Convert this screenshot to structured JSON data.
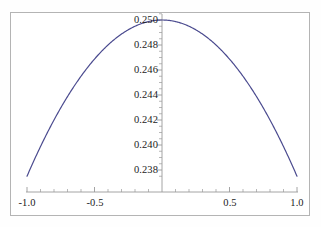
{
  "figure": {
    "name": "parabola-plot",
    "background_color": "#ffffff",
    "frame_color": "#b4b4b4",
    "axis_color": "#9a9a9a",
    "curve_color": "#4b4b8f",
    "text_color": "#1b1b1b"
  },
  "chart_data": {
    "type": "line",
    "title": "",
    "subtitle": "",
    "xlabel": "",
    "ylabel": "",
    "xlim": [
      -1.0,
      1.0
    ],
    "ylim": [
      0.237,
      0.2504
    ],
    "grid": false,
    "legend": null,
    "legend_position": "none",
    "x_ticks": [
      -1.0,
      -0.5,
      0.5,
      1.0
    ],
    "x_tick_labels": [
      "-1.0",
      "-0.5",
      "0.5",
      "1.0"
    ],
    "x_minor_tick_step": 0.1,
    "y_ticks": [
      0.238,
      0.24,
      0.242,
      0.244,
      0.246,
      0.248,
      0.25
    ],
    "y_tick_labels": [
      "0.238",
      "0.240",
      "0.242",
      "0.244",
      "0.246",
      "0.248",
      "0.250"
    ],
    "y_minor_tick_step": 0.0005,
    "series": [
      {
        "name": "curve",
        "color": "#4b4b8f",
        "line_width": 1.2,
        "x": [
          -1.0,
          -0.95,
          -0.9,
          -0.85,
          -0.8,
          -0.75,
          -0.7,
          -0.65,
          -0.6,
          -0.55,
          -0.5,
          -0.45,
          -0.4,
          -0.35,
          -0.3,
          -0.25,
          -0.2,
          -0.15,
          -0.1,
          -0.05,
          0.0,
          0.05,
          0.1,
          0.15,
          0.2,
          0.25,
          0.3,
          0.35,
          0.4,
          0.45,
          0.5,
          0.55,
          0.6,
          0.65,
          0.7,
          0.75,
          0.8,
          0.85,
          0.9,
          0.95,
          1.0
        ],
        "y": [
          0.2375,
          0.23806,
          0.23858,
          0.23903,
          0.23944,
          0.2398,
          0.24011,
          0.24038,
          0.2406,
          0.24078,
          0.24091,
          0.241,
          0.24104,
          0.24104,
          0.24104,
          0.24104,
          0.24104,
          0.24104,
          0.24104,
          0.24104,
          0.25,
          0.24104,
          0.24104,
          0.24104,
          0.24104,
          0.24104,
          0.24104,
          0.24104,
          0.24104,
          0.241,
          0.24091,
          0.24078,
          0.2406,
          0.24038,
          0.24011,
          0.2398,
          0.23944,
          0.23903,
          0.23858,
          0.23806,
          0.2375
        ],
        "formula": "0.25 - 0.0125*x^2",
        "vertex": [
          0.0,
          0.25
        ],
        "endpoints": [
          [
            -1.0,
            0.2375
          ],
          [
            1.0,
            0.2375
          ]
        ]
      }
    ]
  }
}
